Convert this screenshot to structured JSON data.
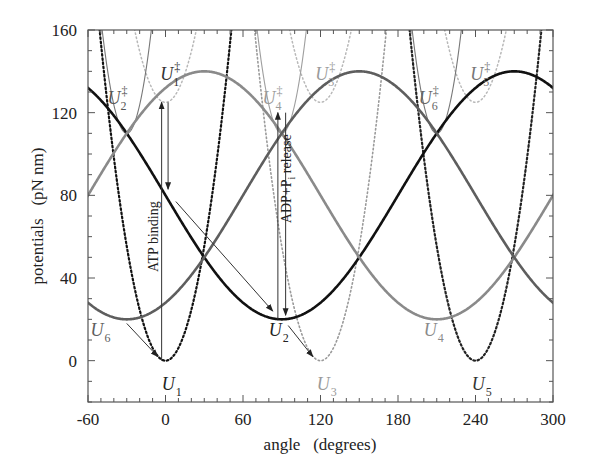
{
  "chart_data": {
    "type": "line",
    "title": "",
    "xlabel": "angle   (degrees)",
    "ylabel": "potentials   (pN nm)",
    "xlim": [
      -60,
      300
    ],
    "ylim": [
      -20,
      160
    ],
    "xticks": [
      -60,
      0,
      60,
      120,
      180,
      240,
      300
    ],
    "yticks": [
      0,
      40,
      80,
      120,
      160
    ],
    "grid": false,
    "legend": "none (inline curve labels)",
    "series": [
      {
        "name": "U2",
        "style": "solid-thick",
        "color": "#111111",
        "form": "80 - 60*cos(theta - 90)",
        "min": {
          "x": 90,
          "y": 20
        },
        "max": {
          "x": 270,
          "y": 140
        }
      },
      {
        "name": "U4",
        "style": "solid-thick",
        "color": "#8a8a8a",
        "form": "80 - 60*cos(theta - 210)",
        "min": {
          "x": 210,
          "y": 20
        },
        "max": {
          "x": 30,
          "y": 140
        }
      },
      {
        "name": "U6",
        "style": "solid-thick",
        "color": "#5e5e5e",
        "form": "80 - 60*cos(theta + 30)",
        "min": {
          "x": -30,
          "y": 20
        },
        "max": {
          "x": 150,
          "y": 140
        }
      },
      {
        "name": "U1",
        "style": "dotted-thick",
        "color": "#111111",
        "form": "0.0615*(theta - 0)^2",
        "min": {
          "x": 0,
          "y": 0
        }
      },
      {
        "name": "U3",
        "style": "dotted-thin",
        "color": "#9a9a9a",
        "form": "0.0615*(theta - 120)^2",
        "min": {
          "x": 120,
          "y": 0
        }
      },
      {
        "name": "U5",
        "style": "dotted-thick",
        "color": "#333333",
        "form": "0.0615*(theta - 240)^2",
        "min": {
          "x": 240,
          "y": 0
        }
      },
      {
        "name": "U‡1",
        "style": "dotted-light",
        "color": "#b5b5b5",
        "form": "125 + 0.0615*(theta - 0)^2",
        "min": {
          "x": 0,
          "y": 125
        }
      },
      {
        "name": "U‡3",
        "style": "dotted-light",
        "color": "#b5b5b5",
        "form": "125 + 0.0615*(theta - 120)^2",
        "min": {
          "x": 120,
          "y": 125
        }
      },
      {
        "name": "U‡5",
        "style": "dotted-light",
        "color": "#b5b5b5",
        "form": "125 + 0.0615*(theta - 240)^2",
        "min": {
          "x": 240,
          "y": 125
        }
      },
      {
        "name": "U‡2",
        "style": "solid-thin",
        "color": "#777777",
        "form": "110 + 0.138*(theta + 30)^2",
        "min": {
          "x": -30,
          "y": 110
        }
      },
      {
        "name": "U‡4",
        "style": "solid-thin",
        "color": "#999999",
        "form": "110 + 0.138*(theta - 90)^2",
        "min": {
          "x": 90,
          "y": 110
        }
      },
      {
        "name": "U‡6",
        "style": "solid-thin",
        "color": "#777777",
        "form": "110 + 0.138*(theta - 210)^2",
        "min": {
          "x": 210,
          "y": 110
        }
      }
    ],
    "params": {
      "cosine": [
        {
          "name": "U2",
          "phase": 90,
          "color": "#111111",
          "width": 2.6
        },
        {
          "name": "U4",
          "phase": 210,
          "color": "#8a8a8a",
          "width": 2.6
        },
        {
          "name": "U6",
          "phase": -30,
          "color": "#5e5e5e",
          "width": 2.6
        }
      ],
      "wells": [
        {
          "name": "U1",
          "center": 0,
          "offset": 0,
          "k": 0.0615,
          "color": "#111111",
          "width": 2.2,
          "dash": "1.6 2.6"
        },
        {
          "name": "U3",
          "center": 120,
          "offset": 0,
          "k": 0.0615,
          "color": "#9a9a9a",
          "width": 1.6,
          "dash": "1.4 2.6"
        },
        {
          "name": "U5",
          "center": 240,
          "offset": 0,
          "k": 0.0615,
          "color": "#222222",
          "width": 2.2,
          "dash": "1.6 2.6"
        },
        {
          "name": "U‡1",
          "center": 0,
          "offset": 125,
          "k": 0.0615,
          "color": "#b8b8b8",
          "width": 1.5,
          "dash": "1.4 2.8"
        },
        {
          "name": "U‡3",
          "center": 120,
          "offset": 125,
          "k": 0.0615,
          "color": "#b8b8b8",
          "width": 1.5,
          "dash": "1.4 2.8"
        },
        {
          "name": "U‡5",
          "center": 240,
          "offset": 125,
          "k": 0.0615,
          "color": "#b8b8b8",
          "width": 1.5,
          "dash": "1.4 2.8"
        },
        {
          "name": "U‡2",
          "center": -30,
          "offset": 110,
          "k": 0.138,
          "color": "#777777",
          "width": 1.1,
          "dash": ""
        },
        {
          "name": "U‡4",
          "center": 90,
          "offset": 110,
          "k": 0.138,
          "color": "#9f9f9f",
          "width": 1.1,
          "dash": ""
        },
        {
          "name": "U‡6",
          "center": 210,
          "offset": 110,
          "k": 0.138,
          "color": "#777777",
          "width": 1.1,
          "dash": ""
        }
      ]
    },
    "arrows": [
      {
        "from": [
          -3,
          0
        ],
        "to": [
          -3,
          125
        ],
        "label": "ATP binding (up)"
      },
      {
        "from": [
          2,
          125
        ],
        "to": [
          2,
          83
        ],
        "label": "ATP binding (down)"
      },
      {
        "from": [
          8,
          77
        ],
        "to": [
          83,
          24
        ]
      },
      {
        "from": [
          -30,
          18
        ],
        "to": [
          -6,
          2
        ]
      },
      {
        "from": [
          87,
          20
        ],
        "to": [
          87,
          120
        ],
        "label": "ADP+Pi release (up)"
      },
      {
        "from": [
          93,
          120
        ],
        "to": [
          93,
          22
        ],
        "label": "ADP+Pi release (down)"
      },
      {
        "from": [
          95,
          17
        ],
        "to": [
          114,
          2
        ]
      }
    ],
    "annotations": [
      {
        "text": "ATP binding",
        "x": -6,
        "y": 60,
        "rotation": -90
      },
      {
        "text": "ADP+P",
        "sub": "i",
        "suffix": " release",
        "x": 97,
        "y": 88,
        "rotation": -90
      }
    ],
    "labels": [
      {
        "base": "U",
        "sub": "1",
        "x": -3,
        "y": -14,
        "color": "#222222"
      },
      {
        "base": "U",
        "sub": "2",
        "x": 80,
        "y": 12,
        "color": "#222222"
      },
      {
        "base": "U",
        "sub": "3",
        "x": 117,
        "y": -14,
        "color": "#9a9a9a"
      },
      {
        "base": "U",
        "sub": "4",
        "x": 200,
        "y": 12,
        "color": "#8a8a8a"
      },
      {
        "base": "U",
        "sub": "5",
        "x": 237,
        "y": -14,
        "color": "#333333"
      },
      {
        "base": "U",
        "sub": "6",
        "x": -58,
        "y": 12,
        "color": "#5e5e5e"
      },
      {
        "base": "U",
        "sub": "1",
        "sup": "‡",
        "x": -4,
        "y": 136,
        "color": "#333333"
      },
      {
        "base": "U",
        "sub": "2",
        "sup": "‡",
        "x": -45,
        "y": 124,
        "color": "#555555"
      },
      {
        "base": "U",
        "sub": "3",
        "sup": "‡",
        "x": 116,
        "y": 136,
        "color": "#9a9a9a"
      },
      {
        "base": "U",
        "sub": "4",
        "sup": "‡",
        "x": 75,
        "y": 124,
        "color": "#9a9a9a"
      },
      {
        "base": "U",
        "sub": "5",
        "sup": "‡",
        "x": 236,
        "y": 136,
        "color": "#777777"
      },
      {
        "base": "U",
        "sub": "6",
        "sup": "‡",
        "x": 196,
        "y": 124,
        "color": "#666666"
      }
    ]
  },
  "axes": {
    "x_tick_labels": [
      "-60",
      "0",
      "60",
      "120",
      "180",
      "240",
      "300"
    ],
    "y_tick_labels": [
      "0",
      "40",
      "80",
      "120",
      "160"
    ],
    "xlabel": "angle   (degrees)",
    "ylabel": "potentials   (pN nm)"
  }
}
